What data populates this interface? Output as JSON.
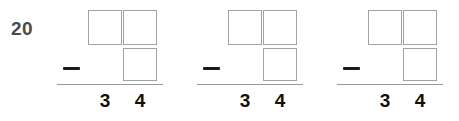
{
  "worksheet": {
    "exercise_number": "20",
    "operator": "−",
    "colors": {
      "background": "#ffffff",
      "box_border": "#a2a2a2",
      "rule": "#9a9a9a",
      "exercise_number_text": "#4a4a4a",
      "answer_text": "#111111",
      "minus_sign": "#1a1a1a"
    },
    "columns": [
      "tens",
      "ones"
    ],
    "problems": [
      {
        "id": "problem-1",
        "minuend_boxes": [
          {
            "column": "tens",
            "value": ""
          },
          {
            "column": "ones",
            "value": ""
          }
        ],
        "subtrahend_boxes": [
          {
            "column": "ones",
            "value": ""
          }
        ],
        "operator": "−",
        "answer": {
          "tens": "3",
          "ones": "4",
          "text": "34"
        }
      },
      {
        "id": "problem-2",
        "minuend_boxes": [
          {
            "column": "tens",
            "value": ""
          },
          {
            "column": "ones",
            "value": ""
          }
        ],
        "subtrahend_boxes": [
          {
            "column": "ones",
            "value": ""
          }
        ],
        "operator": "−",
        "answer": {
          "tens": "3",
          "ones": "4",
          "text": "34"
        }
      },
      {
        "id": "problem-3",
        "minuend_boxes": [
          {
            "column": "tens",
            "value": ""
          },
          {
            "column": "ones",
            "value": ""
          }
        ],
        "subtrahend_boxes": [
          {
            "column": "ones",
            "value": ""
          }
        ],
        "operator": "−",
        "answer": {
          "tens": "3",
          "ones": "4",
          "text": "34"
        }
      }
    ]
  }
}
